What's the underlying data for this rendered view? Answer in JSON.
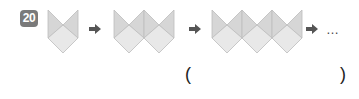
{
  "problem": {
    "number": "20",
    "ellipsis": "…",
    "answer_open": "(",
    "answer_close": ")",
    "answer_value": ""
  },
  "figures": [
    {
      "units": 1
    },
    {
      "units": 2
    },
    {
      "units": 3
    }
  ],
  "colors": {
    "badge": "#7a7a7a",
    "shape_fill_top": "#d4d4d4",
    "shape_fill_bottom": "#e6e6e6",
    "shape_stroke": "#bdbdbd",
    "arrow": "#555555"
  }
}
